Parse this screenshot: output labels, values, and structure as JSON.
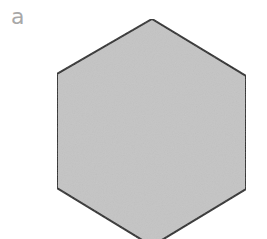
{
  "figure": {
    "panel_label": "a",
    "shape": {
      "type": "hexagon",
      "orientation": "pointy-top",
      "fill": "#c4c4c4",
      "stroke": "#2a2a2a",
      "stroke_width": 2,
      "points": "152,19 246,76 246,189 152,246 57,188 57,74"
    }
  }
}
